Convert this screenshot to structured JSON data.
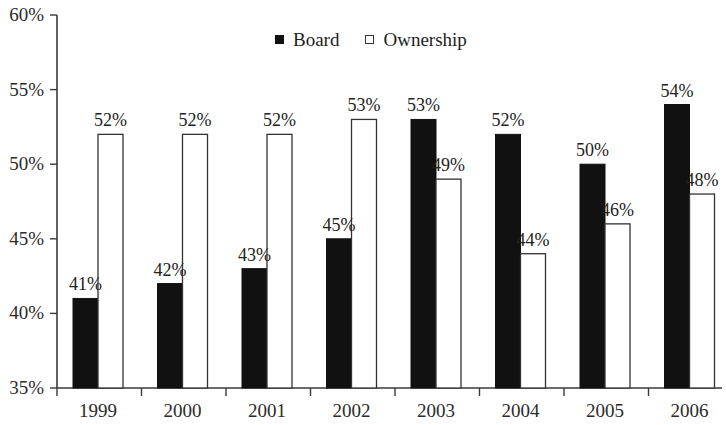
{
  "chart_data": {
    "type": "bar",
    "title": "",
    "subtitle": "",
    "xlabel": "",
    "ylabel": "",
    "categories": [
      "1999",
      "2000",
      "2001",
      "2002",
      "2003",
      "2004",
      "2005",
      "2006"
    ],
    "series": [
      {
        "name": "Board",
        "color": "#111111",
        "style": "filled",
        "values": [
          41,
          42,
          43,
          45,
          53,
          52,
          50,
          54
        ],
        "labels": [
          "41%",
          "42%",
          "43%",
          "45%",
          "53%",
          "52%",
          "50%",
          "54%"
        ]
      },
      {
        "name": "Ownership",
        "color": "#ffffff",
        "style": "hollow",
        "values": [
          52,
          52,
          52,
          53,
          49,
          44,
          46,
          48
        ],
        "labels": [
          "52%",
          "52%",
          "52%",
          "53%",
          "49%",
          "44%",
          "46%",
          "48%"
        ]
      }
    ],
    "ylim": [
      35,
      60
    ],
    "ytick_values": [
      35,
      40,
      45,
      50,
      55,
      60
    ],
    "ytick_labels": [
      "35%",
      "40%",
      "45%",
      "50%",
      "55%",
      "60%"
    ],
    "grid": false,
    "legend_position": "top-center"
  },
  "legend": {
    "entries": [
      {
        "label": "Board",
        "marker": "filled-square-icon"
      },
      {
        "label": "Ownership",
        "marker": "hollow-square-icon"
      }
    ]
  },
  "axes": {
    "y_axis_name": "percent-axis",
    "x_axis_name": "year-axis"
  }
}
